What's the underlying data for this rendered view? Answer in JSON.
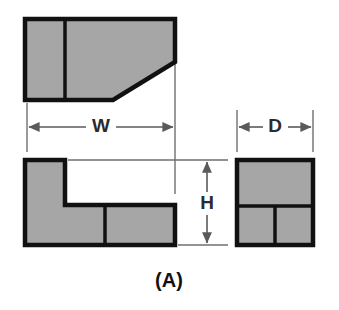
{
  "figure": {
    "label": "(A)",
    "type": "orthographic-projection",
    "background_color": "#ffffff",
    "fill_color": "#a6a6a6",
    "outline_color": "#111111",
    "dimension_line_color": "#5a5a5a",
    "views": [
      {
        "name": "top-view",
        "description": "Rectangle with chamfered lower-right corner, divided by a vertical line near the left",
        "outline_points": "25,19 175,19 175,62 113,100 25,100",
        "internal_lines": [
          {
            "name": "top-view-vertical-divider",
            "points": "65,19 65,100"
          }
        ]
      },
      {
        "name": "front-view",
        "description": "L-shaped profile",
        "outline_points": "25,160 65,160 65,205 175,205 175,245 25,245",
        "internal_lines": [
          {
            "name": "front-view-vertical-divider",
            "points": "105,205 105,245"
          }
        ]
      },
      {
        "name": "right-side-view",
        "description": "Square divided into an upper band and two lower cells",
        "outline_points": "237,160 313,160 313,245 237,245",
        "internal_lines": [
          {
            "name": "side-view-horizontal-divider",
            "points": "237,206 313,206"
          },
          {
            "name": "side-view-vertical-divider",
            "points": "275,206 275,245"
          }
        ]
      }
    ],
    "dimensions": [
      {
        "name": "width-dimension",
        "label": "W",
        "orientation": "horizontal",
        "line_y": 127,
        "from_x": 27,
        "to_x": 175,
        "label_x": 101,
        "label_y": 126,
        "extension_lines": [
          {
            "points": "27,103 27,152"
          },
          {
            "points": "175,62 175,194"
          }
        ]
      },
      {
        "name": "depth-dimension",
        "label": "D",
        "orientation": "horizontal",
        "line_y": 127,
        "from_x": 237,
        "to_x": 313,
        "label_x": 275,
        "label_y": 126,
        "extension_lines": [
          {
            "points": "237,110 237,152"
          },
          {
            "points": "313,110 313,152"
          }
        ]
      },
      {
        "name": "height-dimension",
        "label": "H",
        "orientation": "vertical",
        "line_x": 207,
        "from_y": 160,
        "to_y": 245,
        "label_x": 207,
        "label_y": 203,
        "extension_lines": [
          {
            "points": "68,160 228,160"
          },
          {
            "points": "178,245 228,245"
          }
        ]
      }
    ]
  }
}
